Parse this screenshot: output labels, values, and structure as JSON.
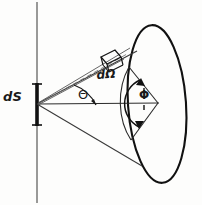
{
  "diagram": {
    "background_color": "#fdfdfc",
    "ink_color": "#1a1a1a",
    "labels": {
      "surface_element": "dS",
      "solid_angle": "dΩ",
      "polar_angle": "Θ",
      "azimuthal_angle": "Φ"
    },
    "geometry": {
      "apex": {
        "x": 37,
        "y": 104
      },
      "vertical_axis_line": {
        "x": 37,
        "y_top": 2,
        "y_bottom": 203
      },
      "surface_element_bar": {
        "x": 37,
        "y_top": 83,
        "y_bottom": 126
      },
      "sphere_ellipse": {
        "cx": 157,
        "cy": 104,
        "rx": 29,
        "ry": 79,
        "rotation_deg": -4
      },
      "cone_upper_contact": {
        "x": 135,
        "y": 53
      },
      "cone_lower_contact": {
        "x": 140,
        "y": 163
      },
      "phi_vertex": {
        "x": 158,
        "y": 103
      },
      "axis_line": {
        "x1": 37,
        "y1": 104,
        "x2": 158,
        "y2": 103
      }
    },
    "elements": [
      "vertical-axis-line",
      "surface-element-bar",
      "central-axis-ray",
      "cone-upper-ray",
      "cone-lower-ray",
      "solid-angle-ray-pair",
      "solid-angle-patch",
      "sphere-ellipse",
      "phi-arc",
      "phi-sector",
      "theta-arc"
    ]
  }
}
